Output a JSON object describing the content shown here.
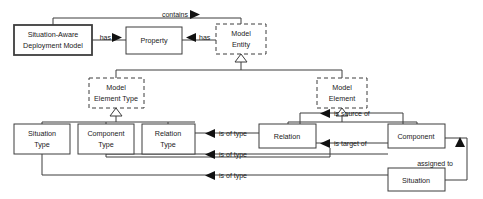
{
  "diagram": {
    "type": "uml-class-diagram",
    "canvas": {
      "width": 483,
      "height": 199
    },
    "colors": {
      "background": "#ffffff",
      "stroke": "#3d3d3d",
      "text": "#1a1a1a",
      "arrow_fill": "#111111"
    },
    "nodes": [
      {
        "id": "sadm",
        "label_lines": [
          "Situation-Aware",
          "Deployment Model"
        ],
        "border": "bold-solid",
        "x": 14,
        "y": 25,
        "w": 78,
        "h": 30
      },
      {
        "id": "property",
        "label_lines": [
          "Property"
        ],
        "border": "solid",
        "x": 126,
        "y": 27,
        "w": 56,
        "h": 27
      },
      {
        "id": "model-entity",
        "label_lines": [
          "Model",
          "Entity"
        ],
        "border": "dashed",
        "x": 216,
        "y": 24,
        "w": 50,
        "h": 30
      },
      {
        "id": "model-element-type",
        "label_lines": [
          "Model",
          "Element Type"
        ],
        "border": "dashed",
        "x": 89,
        "y": 78,
        "w": 55,
        "h": 30
      },
      {
        "id": "model-element",
        "label_lines": [
          "Model",
          "Element"
        ],
        "border": "dashed",
        "x": 317,
        "y": 78,
        "w": 50,
        "h": 30
      },
      {
        "id": "situation-type",
        "label_lines": [
          "Situation",
          "Type"
        ],
        "border": "solid",
        "x": 14,
        "y": 124,
        "w": 56,
        "h": 30
      },
      {
        "id": "component-type",
        "label_lines": [
          "Component",
          "Type"
        ],
        "border": "solid",
        "x": 78,
        "y": 124,
        "w": 56,
        "h": 30
      },
      {
        "id": "relation-type",
        "label_lines": [
          "Relation",
          "Type"
        ],
        "border": "solid",
        "x": 142,
        "y": 124,
        "w": 53,
        "h": 30
      },
      {
        "id": "relation",
        "label_lines": [
          "Relation"
        ],
        "border": "solid",
        "x": 259,
        "y": 124,
        "w": 57,
        "h": 24
      },
      {
        "id": "component",
        "label_lines": [
          "Component"
        ],
        "border": "solid",
        "x": 388,
        "y": 124,
        "w": 57,
        "h": 24
      },
      {
        "id": "situation",
        "label_lines": [
          "Situation"
        ],
        "border": "solid",
        "x": 388,
        "y": 168,
        "w": 57,
        "h": 23
      }
    ],
    "edge_labels": [
      {
        "id": "contains",
        "text": "contains",
        "x": 162,
        "y": 14,
        "arrow": "right"
      },
      {
        "id": "has-left",
        "text": "has",
        "x": 101,
        "y": 37,
        "arrow": "right"
      },
      {
        "id": "has-right",
        "text": "has",
        "x": 199,
        "y": 37,
        "arrow": "left"
      },
      {
        "id": "is-of-type-1",
        "text": "is of type",
        "x": 219,
        "y": 133,
        "arrow": "left"
      },
      {
        "id": "is-of-type-2",
        "text": "is of type",
        "x": 219,
        "y": 154,
        "arrow": "left"
      },
      {
        "id": "is-of-type-3",
        "text": "is of type",
        "x": 219,
        "y": 175,
        "arrow": "left"
      },
      {
        "id": "is-source-of",
        "text": "is source of",
        "x": 334,
        "y": 119,
        "arrow": "left"
      },
      {
        "id": "is-target-of",
        "text": "is target of",
        "x": 334,
        "y": 152,
        "arrow": "left"
      },
      {
        "id": "assigned-to",
        "text": "assigned to",
        "x": 415,
        "y": 163,
        "arrow": "up"
      }
    ]
  }
}
